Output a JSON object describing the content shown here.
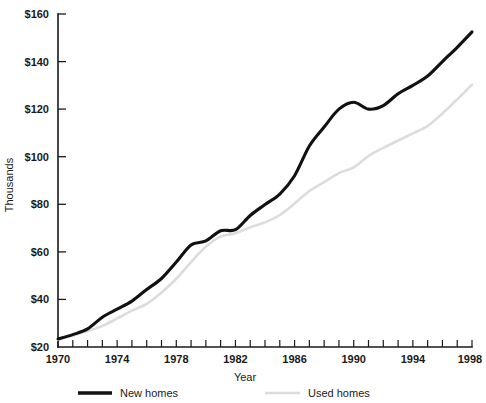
{
  "chart_data": {
    "type": "line",
    "title": "",
    "xlabel": "Year",
    "ylabel": "Thousands",
    "xlim": [
      1970,
      1998
    ],
    "ylim": [
      20,
      160
    ],
    "grid": false,
    "legend_position": "bottom",
    "x": [
      1970,
      1971,
      1972,
      1973,
      1974,
      1975,
      1976,
      1977,
      1978,
      1979,
      1980,
      1981,
      1982,
      1983,
      1984,
      1985,
      1986,
      1987,
      1988,
      1989,
      1990,
      1991,
      1992,
      1993,
      1994,
      1995,
      1996,
      1997,
      1998
    ],
    "x_tick_labels": [
      "1970",
      "1974",
      "1978",
      "1982",
      "1986",
      "1990",
      "1994",
      "1998"
    ],
    "x_tick_values": [
      1970,
      1974,
      1978,
      1982,
      1986,
      1990,
      1994,
      1998
    ],
    "y_tick_labels": [
      "$20",
      "$40",
      "$60",
      "$80",
      "$100",
      "$120",
      "$140",
      "$160"
    ],
    "y_tick_values": [
      20,
      40,
      60,
      80,
      100,
      120,
      140,
      160
    ],
    "series": [
      {
        "name": "New homes",
        "color": "#111111",
        "values": [
          23.4,
          25.2,
          27.6,
          32.5,
          35.9,
          39.3,
          44.2,
          48.8,
          55.7,
          62.9,
          64.6,
          68.9,
          69.3,
          75.3,
          79.9,
          84.3,
          92.0,
          104.5,
          112.5,
          120.0,
          122.9,
          120.0,
          121.5,
          126.5,
          130.0,
          133.9,
          140.0,
          146.0,
          152.5
        ]
      },
      {
        "name": "Used homes",
        "color": "#dcdcdc",
        "values": [
          23.0,
          24.8,
          26.7,
          28.9,
          32.0,
          35.3,
          38.1,
          42.9,
          48.7,
          55.7,
          62.2,
          66.4,
          67.8,
          70.3,
          72.4,
          75.5,
          80.3,
          85.6,
          89.3,
          93.1,
          95.5,
          100.3,
          103.7,
          106.8,
          109.8,
          112.9,
          118.2,
          124.1,
          130.3
        ]
      }
    ]
  },
  "legend": {
    "items": [
      {
        "label": "New homes",
        "color": "#111111"
      },
      {
        "label": "Used homes",
        "color": "#dcdcdc"
      }
    ]
  },
  "axes": {
    "y_axis_title": "Thousands",
    "x_axis_title": "Year"
  }
}
